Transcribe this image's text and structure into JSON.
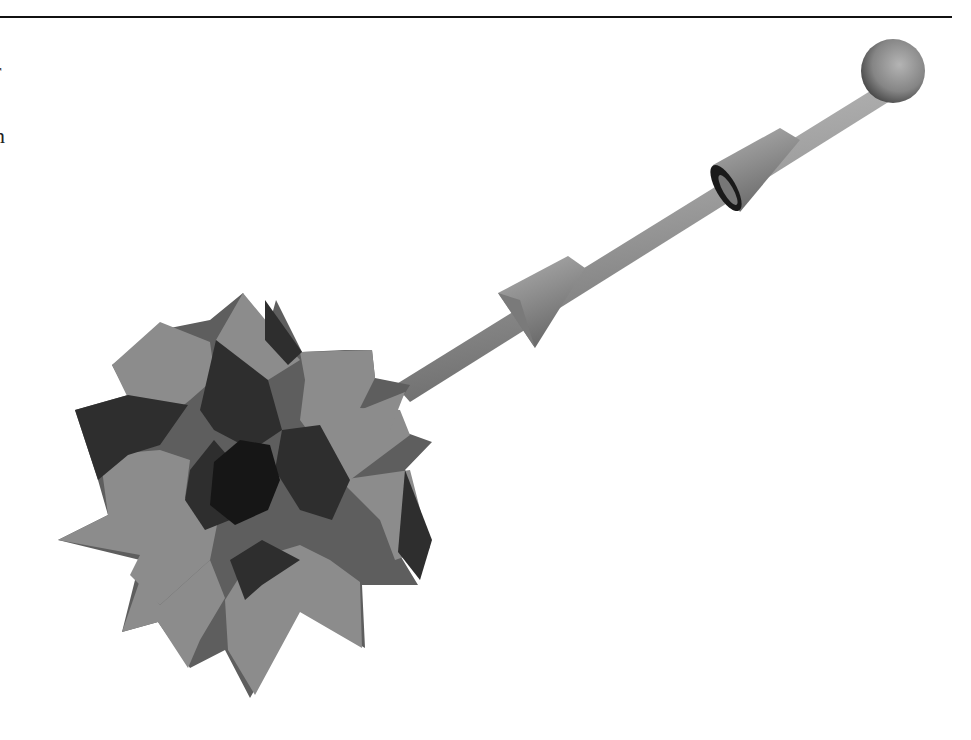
{
  "page": {
    "edge_text": [
      "r",
      "n"
    ]
  },
  "figure": {
    "colors": {
      "light_face": "#8a8a8a",
      "mid_face": "#5e5e5e",
      "dark_face": "#2e2e2e",
      "darkest_face": "#161616",
      "rod": "#9a9a9a",
      "sphere": "#8c8c8c"
    }
  }
}
